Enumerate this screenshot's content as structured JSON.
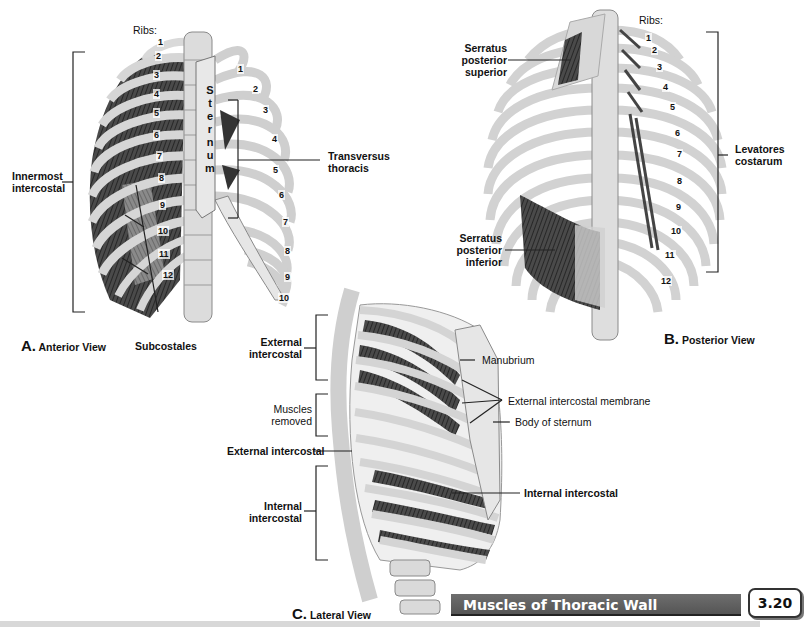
{
  "page": {
    "title": "Muscles of Thoracic Wall",
    "section_number": "3.20"
  },
  "views": {
    "anterior": {
      "letter": "A.",
      "caption": "Anterior View",
      "ribs_label": "Ribs:",
      "sternum_text": "S t e r n u m",
      "sternum_letters": [
        "S",
        "t",
        "e",
        "r",
        "n",
        "u",
        "m"
      ],
      "left_rib_numbers": [
        "1",
        "2",
        "3",
        "4",
        "5",
        "6",
        "7",
        "8",
        "9",
        "10",
        "11",
        "12"
      ],
      "right_rib_numbers": [
        "1",
        "2",
        "3",
        "4",
        "5",
        "6",
        "7",
        "8",
        "9",
        "10"
      ],
      "labels": {
        "innermost_intercostal": "Innermost\nintercostal",
        "innermost_line1": "Innermost",
        "innermost_line2": "intercostal",
        "subcostales": "Subcostales",
        "transversus_line1": "Transversus",
        "transversus_line2": "thoracis"
      }
    },
    "posterior": {
      "letter": "B.",
      "caption": "Posterior View",
      "ribs_label": "Ribs:",
      "rib_numbers": [
        "1",
        "2",
        "3",
        "4",
        "5",
        "6",
        "7",
        "8",
        "9",
        "10",
        "11",
        "12"
      ],
      "labels": {
        "sps_line1": "Serratus",
        "sps_line2": "posterior",
        "sps_line3": "superior",
        "spi_line1": "Serratus",
        "spi_line2": "posterior",
        "spi_line3": "inferior",
        "lev_line1": "Levatores",
        "lev_line2": "costarum"
      }
    },
    "lateral": {
      "letter": "C.",
      "caption": "Lateral View",
      "labels": {
        "ext_line1": "External",
        "ext_line2": "intercostal",
        "muscles_removed_line1": "Muscles",
        "muscles_removed_line2": "removed",
        "external_intercostal_single": "External intercostal",
        "int_line1": "Internal",
        "int_line2": "intercostal",
        "manubrium": "Manubrium",
        "external_intercostal_membrane": "External intercostal membrane",
        "body_of_sternum": "Body of sternum",
        "internal_intercostal": "Internal intercostal"
      }
    }
  },
  "colors": {
    "bone": "#e4e4e4",
    "bone_outline": "#8a8a8a",
    "muscle": "#3a3a3a",
    "banner": "#5f5f5f",
    "banner_text": "#ffffff"
  }
}
